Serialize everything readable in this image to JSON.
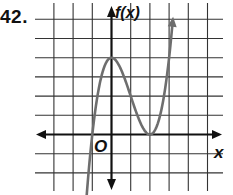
{
  "problem": {
    "number": "42."
  },
  "chart_data": {
    "type": "line",
    "title": "",
    "xlabel": "x",
    "ylabel": "f(x)",
    "origin_label": "O",
    "function": "(x+1)(x-2)^2",
    "grid": true,
    "legend": "none",
    "xlim": [
      -4,
      6
    ],
    "ylim": [
      -2,
      6
    ],
    "grid_step": 1,
    "key_points": [
      {
        "x": -1,
        "y": 0,
        "type": "x-intercept"
      },
      {
        "x": 0,
        "y": 4,
        "type": "relative maximum"
      },
      {
        "x": 2,
        "y": 0,
        "type": "relative minimum / x-intercept (tangent)"
      }
    ],
    "series": [
      {
        "name": "f(x)",
        "x": [
          -1.35,
          -1.2,
          -1,
          -0.75,
          -0.5,
          -0.25,
          0,
          0.25,
          0.5,
          0.75,
          1,
          1.25,
          1.5,
          1.75,
          2,
          2.25,
          2.5,
          2.75,
          3,
          3.2
        ],
        "values": [
          -2.7,
          -2.02,
          0,
          1.64,
          3.13,
          3.84,
          4,
          3.52,
          2.81,
          2.73,
          2,
          1.27,
          0.63,
          0.17,
          0,
          0.2,
          0.88,
          2.11,
          4,
          6.05
        ]
      }
    ],
    "colors": {
      "curve": "#6e6e6e",
      "axes": "#111111",
      "grid": "#333333"
    }
  }
}
